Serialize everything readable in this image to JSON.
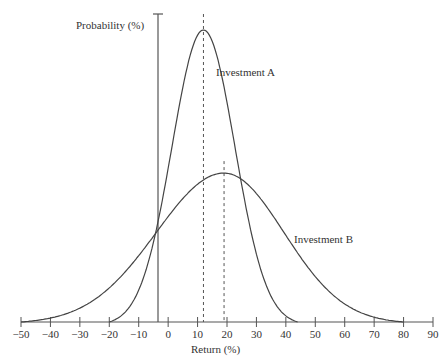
{
  "chart_data": {
    "type": "line",
    "title": "",
    "xlabel": "Return (%)",
    "ylabel": "Probability (%)",
    "xlim": [
      -50,
      90
    ],
    "x_ticks": [
      -50,
      -40,
      -30,
      -20,
      -10,
      0,
      10,
      20,
      30,
      40,
      50,
      60,
      70,
      80,
      90
    ],
    "x_tick_labels": [
      "−50",
      "−40",
      "−30",
      "−20",
      "−10",
      "0",
      "10",
      "20",
      "30",
      "40",
      "50",
      "60",
      "70",
      "80",
      "90"
    ],
    "grid": false,
    "legend": "inline labels",
    "series": [
      {
        "name": "Investment A",
        "distribution": "normal",
        "mean": 12,
        "support": [
          -20,
          44
        ],
        "relative_peak_height": 1.0,
        "mean_marker": "dashed vertical line"
      },
      {
        "name": "Investment B",
        "distribution": "normal",
        "mean": 19,
        "support": [
          -50,
          80
        ],
        "relative_peak_height": 0.51,
        "mean_marker": "dashed vertical line"
      }
    ],
    "annotations": [
      "Investment A",
      "Investment B"
    ]
  },
  "labels": {
    "y_axis": "Probability (%)",
    "x_axis": "Return (%)",
    "series_a": "Investment A",
    "series_b": "Investment B"
  }
}
